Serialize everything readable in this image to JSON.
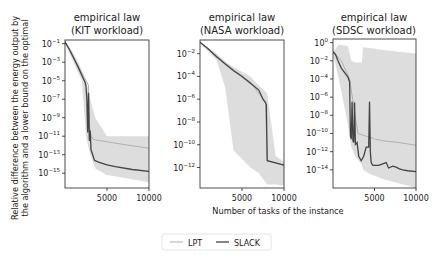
{
  "figure": {
    "shared_ylabel_line1": "Relative difference between the energy output by",
    "shared_ylabel_line2": "the algorithm and a lower bound on the optimal",
    "shared_xlabel": "Number of tasks of the instance",
    "legend": [
      {
        "label": "LPT",
        "color": "#b0b0b0",
        "width": 1
      },
      {
        "label": "SLACK",
        "color": "#444444",
        "width": 1.3
      }
    ],
    "band_color": "#d9d9d9"
  },
  "chart_data": [
    {
      "type": "line",
      "title": "empirical law\n(KIT workload)",
      "title_line1": "empirical law",
      "title_line2": "(KIT workload)",
      "xlabel": "Number of tasks of the instance",
      "ylabel": "Relative difference between the energy output by the algorithm and a lower bound on the optimal",
      "yscale": "log",
      "xlim": [
        0,
        10000
      ],
      "ylim_exp": [
        -16.6,
        -0.6
      ],
      "xticks": [
        5000,
        10000
      ],
      "xtick_labels": [
        "5000",
        "10000"
      ],
      "yticks_exp": [
        -1,
        -3,
        -5,
        -7,
        -9,
        -11,
        -13,
        -15
      ],
      "ytick_labels": [
        "10^-1",
        "10^-3",
        "10^-5",
        "10^-7",
        "10^-9",
        "10^-11",
        "10^-13",
        "10^-15"
      ],
      "series": [
        {
          "name": "LPT",
          "x": [
            0,
            500,
            1000,
            1500,
            2000,
            2500,
            2800,
            2900,
            3000,
            3200,
            3600,
            5000,
            7000,
            10000
          ],
          "log10_y": [
            -0.8,
            -1.5,
            -2.4,
            -3.3,
            -4.2,
            -5.0,
            -5.5,
            -9.8,
            -10.6,
            -11.2,
            -11.4,
            -11.6,
            -11.9,
            -12.3
          ]
        },
        {
          "name": "SLACK",
          "x": [
            0,
            500,
            1000,
            1500,
            2000,
            2400,
            2500,
            2600,
            2700,
            2800,
            2900,
            3000,
            3100,
            3300,
            3500,
            4000,
            5000,
            6000,
            8000,
            10000
          ],
          "log10_y": [
            -0.8,
            -1.6,
            -2.5,
            -3.4,
            -4.4,
            -5.2,
            -5.6,
            -7.0,
            -10.6,
            -6.3,
            -11.5,
            -10.4,
            -12.5,
            -13.0,
            -13.6,
            -13.8,
            -14.1,
            -14.3,
            -14.6,
            -14.8
          ]
        }
      ],
      "band": {
        "x": [
          0,
          1000,
          2000,
          2500,
          3000,
          3600,
          5000,
          7000,
          10000
        ],
        "upper_log10": [
          -0.8,
          -2.0,
          -3.8,
          -5.0,
          -7.0,
          -9.0,
          -11.0,
          -11.0,
          -11.0
        ],
        "lower_log10": [
          -0.9,
          -3.0,
          -5.0,
          -11.0,
          -13.0,
          -14.5,
          -15.2,
          -15.5,
          -16.0
        ]
      },
      "grid": false
    },
    {
      "type": "line",
      "title": "empirical law\n(NASA workload)",
      "title_line1": "empirical law",
      "title_line2": "(NASA workload)",
      "xlabel": "Number of tasks of the instance",
      "yscale": "log",
      "xlim": [
        0,
        10000
      ],
      "ylim_exp": [
        -13.8,
        -0.8
      ],
      "xticks": [
        5000,
        10000
      ],
      "xtick_labels": [
        "5000",
        "10000"
      ],
      "yticks_exp": [
        -2,
        -4,
        -6,
        -8,
        -10,
        -12
      ],
      "ytick_labels": [
        "10^-2",
        "10^-4",
        "10^-6",
        "10^-8",
        "10^-10",
        "10^-12"
      ],
      "series": [
        {
          "name": "LPT",
          "x": [
            0,
            2000,
            4000,
            6000,
            7500,
            7800,
            8000,
            9000,
            10000
          ],
          "log10_y": [
            -1.0,
            -2.2,
            -3.4,
            -4.5,
            -6.0,
            -6.3,
            -11.4,
            -11.6,
            -11.8
          ]
        },
        {
          "name": "SLACK",
          "x": [
            0,
            1000,
            2000,
            3000,
            4000,
            5000,
            6000,
            7000,
            7500,
            7800,
            7900,
            8000,
            9000,
            10000
          ],
          "log10_y": [
            -1.0,
            -1.6,
            -2.3,
            -2.9,
            -3.5,
            -4.0,
            -4.6,
            -5.2,
            -6.0,
            -6.3,
            -6.5,
            -11.4,
            -11.6,
            -11.8
          ]
        }
      ],
      "band": {
        "x": [
          0,
          2000,
          3000,
          4000,
          6000,
          7000,
          8000,
          9000,
          10000
        ],
        "upper_log10": [
          -1.0,
          -2.0,
          -2.7,
          -3.2,
          -4.0,
          -4.8,
          -5.5,
          -11.0,
          -11.5
        ],
        "lower_log10": [
          -1.1,
          -2.6,
          -5.0,
          -10.5,
          -12.0,
          -12.5,
          -13.5,
          -13.5,
          -13.6
        ]
      },
      "grid": false
    },
    {
      "type": "line",
      "title": "empirical law\n(SDSC workload)",
      "title_line1": "empirical law",
      "title_line2": "(SDSC workload)",
      "xlabel": "Number of tasks of the instance",
      "yscale": "log",
      "xlim": [
        0,
        10000
      ],
      "ylim_exp": [
        -16.0,
        0.4
      ],
      "xticks": [
        5000,
        10000
      ],
      "xtick_labels": [
        "5000",
        "10000"
      ],
      "yticks_exp": [
        0,
        -2,
        -4,
        -6,
        -8,
        -10,
        -12,
        -14
      ],
      "ytick_labels": [
        "10^0",
        "10^-2",
        "10^-4",
        "10^-6",
        "10^-8",
        "10^-10",
        "10^-12",
        "10^-14"
      ],
      "series": [
        {
          "name": "LPT",
          "x": [
            0,
            1000,
            2000,
            3000,
            4000,
            5000,
            6000,
            8000,
            10000
          ],
          "log10_y": [
            -1.0,
            -2.0,
            -4.0,
            -10.0,
            -10.3,
            -10.6,
            -10.8,
            -11.0,
            -11.3
          ]
        },
        {
          "name": "SLACK",
          "x": [
            0,
            300,
            600,
            1000,
            1400,
            1800,
            2000,
            2100,
            2200,
            2300,
            2400,
            2500,
            2600,
            2700,
            2900,
            3100,
            3400,
            3700,
            4000,
            4300,
            4400,
            4500,
            4600,
            4800,
            5500,
            6400,
            6700,
            7200,
            7600,
            8000,
            8400,
            9000,
            10000
          ],
          "log10_y": [
            -1.0,
            -1.3,
            -2.0,
            -2.8,
            -3.3,
            -3.8,
            -4.3,
            -10.3,
            -10.6,
            -6.5,
            -10.8,
            -11.0,
            -6.6,
            -11.2,
            -11.0,
            -12.5,
            -13.0,
            -12.5,
            -11.5,
            -11.5,
            -6.5,
            -12.0,
            -13.2,
            -13.5,
            -13.5,
            -13.2,
            -13.8,
            -13.6,
            -13.7,
            -13.9,
            -14.0,
            -14.1,
            -14.2
          ]
        }
      ],
      "band": {
        "x": [
          0,
          700,
          1800,
          2200,
          2700,
          3500,
          3600,
          4500,
          6000,
          8000,
          10000
        ],
        "upper_log10": [
          -1.0,
          -0.2,
          -0.4,
          -2.0,
          -2.2,
          -2.2,
          -0.5,
          -0.6,
          -0.8,
          -1.0,
          -1.2
        ],
        "lower_log10": [
          -1.2,
          -4.0,
          -9.0,
          -11.5,
          -12.5,
          -13.5,
          -14.0,
          -14.5,
          -15.0,
          -15.5,
          -16.0
        ]
      },
      "grid": false
    }
  ],
  "panels_layout": [
    {
      "left": 65,
      "right": 149,
      "top": 40,
      "bottom": 188
    },
    {
      "left": 200,
      "right": 284,
      "top": 40,
      "bottom": 188
    },
    {
      "left": 333,
      "right": 416,
      "top": 39,
      "bottom": 188
    }
  ]
}
